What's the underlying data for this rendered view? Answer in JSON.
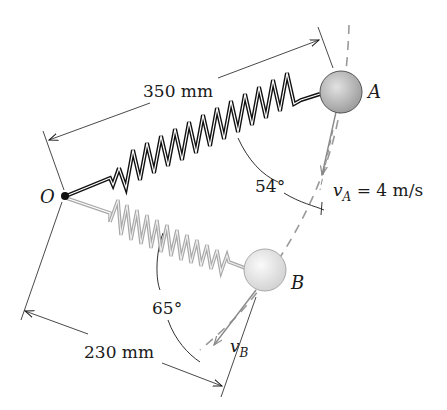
{
  "figure": {
    "type": "mechanics-diagram"
  },
  "points": {
    "pivot": {
      "label": "O"
    },
    "position_a": {
      "label": "A"
    },
    "position_b": {
      "label": "B"
    }
  },
  "dimensions": {
    "length_oa": "350 mm",
    "length_ob": "230 mm"
  },
  "angles": {
    "angle_a": "54°",
    "angle_b": "65°"
  },
  "velocities": {
    "va_symbol": "v",
    "va_subscript": "A",
    "va_value": " = 4 m/s",
    "vb_symbol": "v",
    "vb_subscript": "B"
  },
  "colors": {
    "ink": "#1a1a1a",
    "spring_a": "#111111",
    "spring_b": "#a8a8a8",
    "ball_a": "#b9b9b9",
    "ball_b": "#e6e6e6",
    "dashed_path": "#9a9a9a"
  }
}
